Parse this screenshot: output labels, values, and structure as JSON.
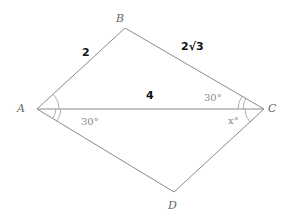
{
  "diagram": {
    "type": "geometry",
    "shape": "quadrilateral ABCD with diagonal AC",
    "vertices": [
      {
        "id": "A",
        "label": "A",
        "x": 37,
        "y": 109,
        "label_x": 17,
        "label_y": 112
      },
      {
        "id": "B",
        "label": "B",
        "x": 125,
        "y": 28,
        "label_x": 116,
        "label_y": 22
      },
      {
        "id": "C",
        "label": "C",
        "x": 264,
        "y": 109,
        "label_x": 268,
        "label_y": 112
      },
      {
        "id": "D",
        "label": "D",
        "x": 174,
        "y": 192,
        "label_x": 168,
        "label_y": 209
      }
    ],
    "edges": [
      {
        "from": "A",
        "to": "B"
      },
      {
        "from": "B",
        "to": "C"
      },
      {
        "from": "C",
        "to": "D"
      },
      {
        "from": "D",
        "to": "A"
      },
      {
        "from": "A",
        "to": "C"
      }
    ],
    "side_labels": {
      "AB": "2",
      "BC": "2√3",
      "AC": "4"
    },
    "angle_labels": {
      "BCA": "30°",
      "CAD": "30°",
      "ACD": "x°"
    }
  }
}
